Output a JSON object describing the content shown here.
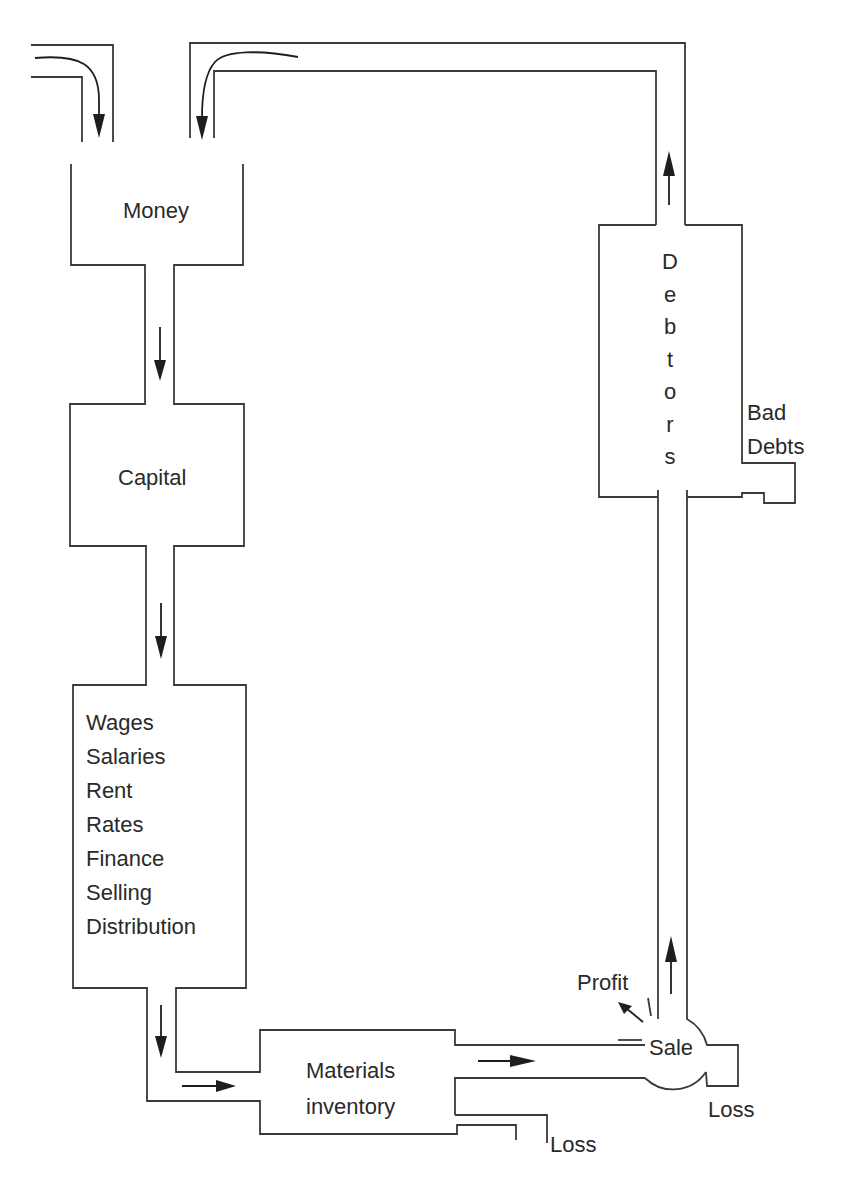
{
  "diagram": {
    "type": "working-capital-cycle flow diagram",
    "stroke_color": "#3a3a3a",
    "arrow_color": "#1e1e1e",
    "nodes": {
      "money": {
        "label": "Money"
      },
      "capital": {
        "label": "Capital"
      },
      "expenses": {
        "items": [
          "Wages",
          "Salaries",
          "Rent",
          "Rates",
          "Finance",
          "Selling",
          "Distribution"
        ]
      },
      "materials": {
        "label_line1": "Materials",
        "label_line2": "inventory"
      },
      "sale": {
        "label": "Sale"
      },
      "debtors": {
        "letters": [
          "D",
          "e",
          "b",
          "t",
          "o",
          "r",
          "s"
        ],
        "label": "Debtors"
      }
    },
    "outflows": {
      "profit": {
        "label": "Profit"
      },
      "bad_debts": {
        "line1": "Bad",
        "line2": "Debts"
      },
      "materials_loss": {
        "label": "Loss"
      },
      "sale_loss": {
        "label": "Loss"
      }
    },
    "flow_sequence": [
      "Money",
      "Capital",
      "Wages/Salaries/Rent/Rates/Finance/Selling/Distribution",
      "Materials inventory",
      "Sale",
      "Debtors",
      "Money"
    ]
  }
}
